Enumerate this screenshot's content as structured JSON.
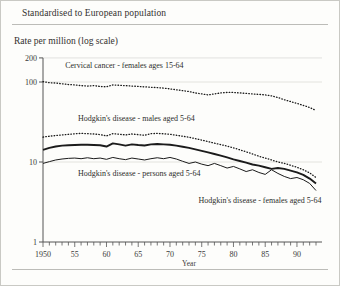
{
  "header": {
    "note": "Standardised to European population"
  },
  "chart_data": {
    "type": "line",
    "title": "",
    "ylabel": "Rate per million (log scale)",
    "xlabel": "Year",
    "scale": "log",
    "grid": false,
    "legend_position": "inline-annotations",
    "ylim": [
      1,
      200
    ],
    "ytick_labels": [
      "200",
      "100",
      "10",
      "1"
    ],
    "ytick_values": [
      200,
      100,
      10,
      1
    ],
    "xlim": [
      1950,
      1993
    ],
    "xtick_labels": [
      "1950",
      "55",
      "60",
      "65",
      "70",
      "75",
      "80",
      "85",
      "90"
    ],
    "xtick_values": [
      1950,
      1955,
      1960,
      1965,
      1970,
      1975,
      1980,
      1985,
      1990
    ],
    "x": [
      1950,
      1951,
      1952,
      1953,
      1954,
      1955,
      1956,
      1957,
      1958,
      1959,
      1960,
      1961,
      1962,
      1963,
      1964,
      1965,
      1966,
      1967,
      1968,
      1969,
      1970,
      1971,
      1972,
      1973,
      1974,
      1975,
      1976,
      1977,
      1978,
      1979,
      1980,
      1981,
      1982,
      1983,
      1984,
      1985,
      1986,
      1987,
      1988,
      1989,
      1990,
      1991,
      1992,
      1993
    ],
    "series": [
      {
        "name": "Cervical cancer - females ages 15-64",
        "style": "dotted",
        "label_x": 1953.5,
        "label_y": 150,
        "values": [
          101,
          98,
          97,
          95,
          93,
          92,
          90,
          89,
          90,
          88,
          87,
          92,
          91,
          90,
          89,
          88,
          87,
          86,
          85,
          84,
          82,
          80,
          78,
          76,
          73,
          71,
          69,
          71,
          73,
          74,
          74,
          73,
          72,
          71,
          70,
          69,
          67,
          64,
          60,
          57,
          54,
          51,
          48,
          44
        ]
      },
      {
        "name": "Hodgkin's disease - males aged 5-64",
        "style": "dotted",
        "label_x": 1955.5,
        "label_y": 33,
        "values": [
          20.5,
          21.0,
          21.4,
          21.8,
          22.2,
          22.5,
          22.8,
          22.6,
          22.4,
          22.0,
          21.2,
          22.6,
          22.2,
          21.8,
          22.4,
          22.0,
          21.6,
          22.6,
          22.8,
          22.5,
          22.2,
          21.6,
          21.0,
          20.4,
          19.6,
          18.8,
          18.0,
          17.2,
          16.5,
          15.8,
          15.0,
          14.2,
          13.4,
          12.6,
          11.8,
          11.2,
          10.6,
          10.0,
          9.6,
          9.1,
          8.6,
          8.0,
          7.3,
          6.4
        ]
      },
      {
        "name": "Hodgkin's disease - persons aged 5-64",
        "style": "thick",
        "label_x": 1955.5,
        "label_y": 6.6,
        "values": [
          14.2,
          15.0,
          15.6,
          16.0,
          16.2,
          16.3,
          16.4,
          16.4,
          16.3,
          16.2,
          15.6,
          17.1,
          16.6,
          16.0,
          16.6,
          16.3,
          16.1,
          16.6,
          16.8,
          16.6,
          16.4,
          16.0,
          15.5,
          15.0,
          14.4,
          13.8,
          13.2,
          12.6,
          12.0,
          11.4,
          10.8,
          10.3,
          9.8,
          9.3,
          9.0,
          8.6,
          8.2,
          8.4,
          8.2,
          7.8,
          7.4,
          6.9,
          6.2,
          5.4
        ]
      },
      {
        "name": "Hodgkin's disease - females aged 5-64",
        "style": "thin",
        "label_x": 1974.5,
        "label_y": 3.05,
        "values": [
          9.6,
          10.1,
          10.6,
          10.9,
          11.1,
          11.2,
          11.0,
          11.3,
          11.0,
          11.2,
          10.8,
          11.4,
          11.0,
          10.7,
          11.2,
          10.9,
          10.6,
          11.0,
          11.3,
          11.0,
          11.4,
          10.9,
          10.2,
          9.6,
          10.0,
          9.4,
          9.0,
          9.6,
          9.0,
          8.4,
          8.8,
          8.2,
          7.6,
          8.0,
          7.4,
          7.0,
          8.0,
          7.2,
          6.6,
          6.2,
          6.4,
          6.0,
          5.4,
          4.4
        ]
      }
    ]
  }
}
